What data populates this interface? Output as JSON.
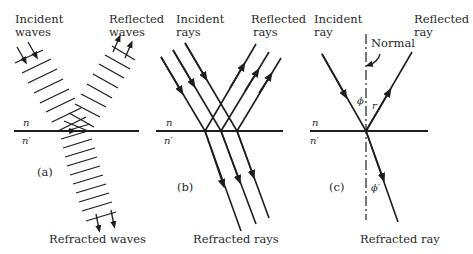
{
  "figure": {
    "panels": [
      {
        "id": "a",
        "caption": "(a)",
        "labels": {
          "incident_line1": "Incident",
          "incident_line2": "waves",
          "reflected_line1": "Reflected",
          "reflected_line2": "waves",
          "refracted": "Refracted waves",
          "n": "n",
          "n_prime": "n′"
        }
      },
      {
        "id": "b",
        "caption": "(b)",
        "labels": {
          "incident_line1": "Incident",
          "incident_line2": "rays",
          "reflected_line1": "Reflected",
          "reflected_line2": "rays",
          "refracted": "Refracted rays",
          "n": "n",
          "n_prime": "n′"
        }
      },
      {
        "id": "c",
        "caption": "(c)",
        "labels": {
          "incident_line1": "Incident",
          "incident_line2": "ray",
          "reflected_line1": "Reflected",
          "reflected_line2": "ray",
          "refracted": "Refracted ray",
          "normal": "Normal",
          "phi": "ϕ",
          "r": "r",
          "phi_prime": "ϕ′",
          "n": "n",
          "n_prime": "n′"
        }
      }
    ],
    "colors": {
      "ink": "#1e1e1e",
      "background": "#ffffff"
    }
  }
}
